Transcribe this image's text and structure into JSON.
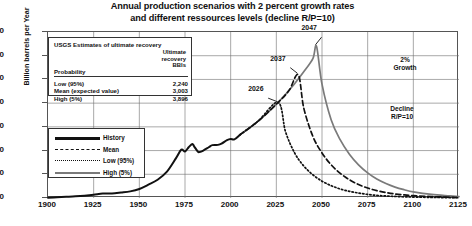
{
  "title_line1": "Annual production scenarios with 2 percent growth rates",
  "title_line2": "and different ressources levels (decline R/P=10)",
  "axes": {
    "ylabel": "Billion barrels per Year",
    "yticks": [
      0,
      10,
      20,
      30,
      40,
      50,
      60,
      70
    ],
    "xticks": [
      1900,
      1925,
      1950,
      1975,
      2000,
      2025,
      2050,
      2075,
      2100,
      2125
    ],
    "xlim": [
      1900,
      2125
    ],
    "ylim": [
      0,
      70
    ]
  },
  "usgs_box": {
    "heading": "USGS Estimates of ultimate recovery",
    "col_header_line1": "Ultimate",
    "col_header_line2": "recovery",
    "col_header_line3": "BBls",
    "prob_header": "Probability",
    "rows": [
      {
        "label": "Low (95%)",
        "value": "2,240"
      },
      {
        "label": "Mean (expected value)",
        "value": "3,003"
      },
      {
        "label": "High (5%)",
        "value": "3,896"
      }
    ]
  },
  "legend": {
    "items": [
      {
        "label": "History",
        "style": "solid-thick",
        "color": "#111111"
      },
      {
        "label": "Mean",
        "style": "dashed",
        "color": "#111111"
      },
      {
        "label": "Low (95%)",
        "style": "dotted",
        "color": "#111111"
      },
      {
        "label": "High (5%)",
        "style": "solid",
        "color": "#7a7a7a"
      }
    ]
  },
  "annotations": {
    "growth": "2%\nGrowth",
    "growth_line1": "2%",
    "growth_line2": "Growth",
    "decline_line1": "Decline",
    "decline_line2": "R/P=10",
    "peaks": [
      {
        "label": "2026",
        "year": 2026,
        "value": 40
      },
      {
        "label": "2037",
        "year": 2037,
        "value": 52
      },
      {
        "label": "2047",
        "year": 2047,
        "value": 64
      }
    ]
  },
  "chart_data": {
    "type": "line",
    "title": "Annual production scenarios with 2 percent growth rates and different ressources levels (decline R/P=10)",
    "xlabel": "",
    "ylabel": "Billion barrels per Year",
    "xlim": [
      1900,
      2125
    ],
    "ylim": [
      0,
      70
    ],
    "grid": true,
    "legend_position": "left-lower",
    "series": [
      {
        "name": "History",
        "style": "solid-thick",
        "color": "#111111",
        "points": [
          [
            1900,
            0.15
          ],
          [
            1905,
            0.3
          ],
          [
            1910,
            0.5
          ],
          [
            1915,
            0.7
          ],
          [
            1920,
            1.0
          ],
          [
            1925,
            1.4
          ],
          [
            1930,
            1.9
          ],
          [
            1935,
            1.9
          ],
          [
            1940,
            2.3
          ],
          [
            1945,
            2.8
          ],
          [
            1950,
            3.8
          ],
          [
            1955,
            5.6
          ],
          [
            1960,
            7.7
          ],
          [
            1965,
            11.0
          ],
          [
            1970,
            16.7
          ],
          [
            1973,
            20.4
          ],
          [
            1975,
            19.6
          ],
          [
            1977,
            21.4
          ],
          [
            1979,
            22.8
          ],
          [
            1980,
            21.8
          ],
          [
            1982,
            19.6
          ],
          [
            1983,
            19.4
          ],
          [
            1985,
            20.0
          ],
          [
            1988,
            21.4
          ],
          [
            1990,
            22.3
          ],
          [
            1993,
            22.4
          ],
          [
            1995,
            22.9
          ],
          [
            1998,
            24.4
          ],
          [
            2000,
            24.9
          ],
          [
            2002,
            24.7
          ],
          [
            2005,
            26.6
          ]
        ]
      },
      {
        "name": "High (5%)",
        "style": "solid",
        "color": "#7a7a7a",
        "description": "2% growth from 2005 to peak in 2047 at 64, then R/P=10 exponential decline",
        "points": [
          [
            2005,
            26.6
          ],
          [
            2010,
            29.4
          ],
          [
            2015,
            32.4
          ],
          [
            2020,
            35.8
          ],
          [
            2026,
            40.3
          ],
          [
            2030,
            43.7
          ],
          [
            2035,
            48.2
          ],
          [
            2040,
            53.2
          ],
          [
            2045,
            58.8
          ],
          [
            2047,
            64.0
          ],
          [
            2050,
            48.0
          ],
          [
            2055,
            33.0
          ],
          [
            2060,
            24.5
          ],
          [
            2065,
            18.5
          ],
          [
            2070,
            14.0
          ],
          [
            2075,
            10.6
          ],
          [
            2080,
            8.0
          ],
          [
            2085,
            6.1
          ],
          [
            2090,
            4.6
          ],
          [
            2095,
            3.5
          ],
          [
            2100,
            2.6
          ],
          [
            2110,
            1.5
          ],
          [
            2120,
            0.9
          ],
          [
            2125,
            0.6
          ]
        ]
      },
      {
        "name": "Mean",
        "style": "dashed",
        "color": "#111111",
        "description": "2% growth to peak in 2037 at 52, then R/P=10 exponential decline",
        "points": [
          [
            2005,
            26.6
          ],
          [
            2015,
            32.4
          ],
          [
            2026,
            40.3
          ],
          [
            2032,
            45.4
          ],
          [
            2037,
            52.0
          ],
          [
            2040,
            38.0
          ],
          [
            2045,
            26.0
          ],
          [
            2050,
            19.0
          ],
          [
            2055,
            14.0
          ],
          [
            2060,
            10.4
          ],
          [
            2065,
            7.7
          ],
          [
            2070,
            5.7
          ],
          [
            2075,
            4.2
          ],
          [
            2080,
            3.1
          ],
          [
            2085,
            2.3
          ],
          [
            2090,
            1.7
          ],
          [
            2095,
            1.3
          ],
          [
            2100,
            1.0
          ],
          [
            2110,
            0.6
          ],
          [
            2120,
            0.3
          ],
          [
            2125,
            0.2
          ]
        ]
      },
      {
        "name": "Low (95%)",
        "style": "dotted",
        "color": "#111111",
        "description": "2% growth to peak in 2026 at 40, then R/P=10 exponential decline",
        "points": [
          [
            2005,
            26.6
          ],
          [
            2015,
            32.4
          ],
          [
            2026,
            40.3
          ],
          [
            2030,
            28.0
          ],
          [
            2035,
            19.0
          ],
          [
            2040,
            13.5
          ],
          [
            2045,
            9.8
          ],
          [
            2050,
            7.1
          ],
          [
            2055,
            5.2
          ],
          [
            2060,
            3.8
          ],
          [
            2065,
            2.8
          ],
          [
            2070,
            2.1
          ],
          [
            2075,
            1.5
          ],
          [
            2080,
            1.1
          ],
          [
            2085,
            0.85
          ],
          [
            2090,
            0.65
          ],
          [
            2095,
            0.5
          ],
          [
            2100,
            0.4
          ],
          [
            2110,
            0.25
          ],
          [
            2120,
            0.15
          ],
          [
            2125,
            0.1
          ]
        ]
      }
    ]
  }
}
